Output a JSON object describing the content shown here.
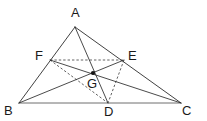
{
  "figure": {
    "canvas": {
      "width": 207,
      "height": 121
    },
    "background_color": "#ffffff",
    "stroke_color": "#2b2b2b",
    "baseline_color": "#6f6f6f",
    "dashed_color": "#3a3a3a",
    "point_color": "#151515"
  },
  "points": {
    "A": {
      "label": "A",
      "x": 75,
      "y": 27,
      "label_x": 71,
      "label_y": 6
    },
    "B": {
      "label": "B",
      "x": 19,
      "y": 103,
      "label_x": 4,
      "label_y": 104
    },
    "C": {
      "label": "C",
      "x": 181,
      "y": 103,
      "label_x": 182,
      "label_y": 104
    },
    "D": {
      "label": "D",
      "x": 108,
      "y": 103,
      "label_x": 104,
      "label_y": 105
    },
    "E": {
      "label": "E",
      "x": 124,
      "y": 60,
      "label_x": 128,
      "label_y": 49
    },
    "F": {
      "label": "F",
      "x": 50,
      "y": 60,
      "label_x": 35,
      "label_y": 49
    },
    "G": {
      "label": "G",
      "x": 93,
      "y": 73,
      "label_x": 87,
      "label_y": 77
    }
  },
  "segments": {
    "solid": [
      {
        "name": "side-AB",
        "from": "A",
        "to": "B"
      },
      {
        "name": "side-AC",
        "from": "A",
        "to": "C"
      },
      {
        "name": "cevian-AD",
        "from": "A",
        "to": "D"
      },
      {
        "name": "cevian-BE",
        "from": "B",
        "to": "E"
      },
      {
        "name": "cevian-CF",
        "from": "C",
        "to": "F"
      }
    ],
    "baseline": [
      {
        "name": "side-BC",
        "from": "B",
        "to": "C"
      }
    ],
    "dashed": [
      {
        "name": "midsegment-FE",
        "from": "F",
        "to": "E"
      },
      {
        "name": "midsegment-FD",
        "from": "F",
        "to": "D"
      },
      {
        "name": "midsegment-ED",
        "from": "E",
        "to": "D"
      }
    ]
  },
  "markers": {
    "centroid": {
      "name": "centroid-point",
      "at": "G",
      "radius": 2.1
    }
  }
}
